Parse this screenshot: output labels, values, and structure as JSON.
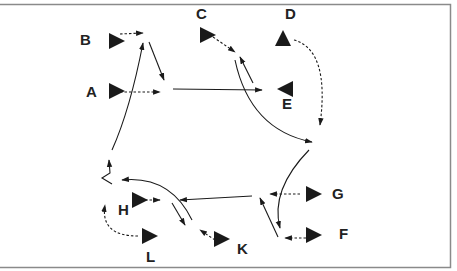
{
  "diagram": {
    "frame_color": "#8a8a8a",
    "ink_color": "#1a1a1a",
    "nodes": [
      {
        "id": "A",
        "label": "A",
        "x": 117,
        "y": 91,
        "dir": "right",
        "lx": 86,
        "ly": 97
      },
      {
        "id": "B",
        "label": "B",
        "x": 117,
        "y": 41,
        "dir": "right",
        "lx": 80,
        "ly": 45
      },
      {
        "id": "C",
        "label": "C",
        "x": 208,
        "y": 35,
        "dir": "right",
        "lx": 196,
        "ly": 19
      },
      {
        "id": "D",
        "label": "D",
        "x": 283,
        "y": 38,
        "dir": "up",
        "lx": 285,
        "ly": 19
      },
      {
        "id": "E",
        "label": "E",
        "x": 285,
        "y": 89,
        "dir": "left",
        "lx": 282,
        "ly": 109
      },
      {
        "id": "F",
        "label": "F",
        "x": 314,
        "y": 235,
        "dir": "right",
        "lx": 339,
        "ly": 239
      },
      {
        "id": "G",
        "label": "G",
        "x": 314,
        "y": 194,
        "dir": "right",
        "lx": 332,
        "ly": 199
      },
      {
        "id": "H",
        "label": "H",
        "x": 140,
        "y": 200,
        "dir": "right",
        "lx": 118,
        "ly": 215
      },
      {
        "id": "K",
        "label": "K",
        "x": 222,
        "y": 239,
        "dir": "right",
        "lx": 237,
        "ly": 254
      },
      {
        "id": "L",
        "label": "L",
        "x": 150,
        "y": 236,
        "dir": "right",
        "lx": 146,
        "ly": 262
      }
    ],
    "edges": [
      {
        "from": "B",
        "to": "B-arrow",
        "style": "dashed",
        "d": "M 120 34 L 143 33"
      },
      {
        "from": "A",
        "to": "A-arrow",
        "style": "dashed",
        "d": "M 120 92 L 160 92"
      },
      {
        "from": "B-arrow",
        "to": "A-arrow",
        "style": "solid",
        "d": "M 149 42 L 164 80"
      },
      {
        "from": "A-junction",
        "to": "E",
        "style": "solid",
        "d": "M 173 89 L 262 90"
      },
      {
        "from": "C",
        "to": "C-arrow",
        "style": "dashed",
        "d": "M 213 37 L 235 52"
      },
      {
        "from": "E-arrow",
        "to": "C-arrow",
        "style": "solid",
        "d": "M 253 83 L 240 57"
      },
      {
        "from": "C-arrow",
        "to": "curve-right",
        "style": "solid",
        "d": "M 235 60 Q 250 130 312 142"
      },
      {
        "from": "D",
        "to": "curve-down",
        "style": "dashed",
        "d": "M 294 40 Q 330 50 320 125"
      },
      {
        "from": "curve-top",
        "to": "F",
        "style": "solid",
        "d": "M 309 150 Q 270 190 280 228"
      },
      {
        "from": "G",
        "to": "G-arrow",
        "style": "dashed",
        "d": "M 300 194 L 270 194"
      },
      {
        "from": "F",
        "to": "F-arrow",
        "style": "dashed",
        "d": "M 306 238 L 285 238"
      },
      {
        "from": "F-arrow",
        "to": "G-arrow",
        "style": "solid",
        "d": "M 278 237 L 260 198"
      },
      {
        "from": "G-junction",
        "to": "H-region",
        "style": "solid",
        "d": "M 252 196 L 180 200"
      },
      {
        "from": "H",
        "to": "H-arrow",
        "style": "dashed",
        "d": "M 145 200 L 160 200"
      },
      {
        "from": "H-curve",
        "to": "K-region",
        "style": "solid",
        "d": "M 172 203 L 185 225"
      },
      {
        "from": "K",
        "to": "K-arrow",
        "style": "dashed",
        "d": "M 215 240 L 200 230"
      },
      {
        "from": "K-curve",
        "to": "H-corner",
        "style": "solid",
        "d": "M 192 220 Q 170 175 122 180"
      },
      {
        "from": "L",
        "to": "H-corner",
        "style": "dashed",
        "d": "M 138 236 Q 100 236 105 205"
      },
      {
        "from": "H-corner",
        "to": "zigzag",
        "style": "solid",
        "d": "M 112 184 L 102 178 L 110 173 L 109 160"
      },
      {
        "from": "zigzag",
        "to": "B-arrow",
        "style": "solid",
        "d": "M 112 150 Q 130 110 143 43"
      }
    ]
  }
}
